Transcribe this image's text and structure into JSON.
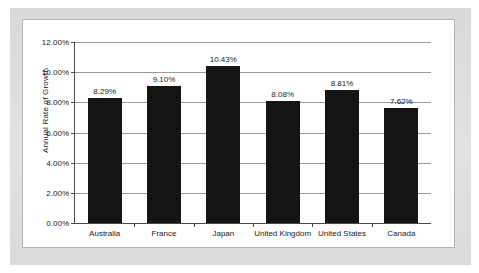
{
  "chart_data": {
    "type": "bar",
    "title": "",
    "xlabel": "",
    "ylabel": "Annual Rate of Growth",
    "ylim": [
      0,
      12
    ],
    "grid": true,
    "legend": "none",
    "y_tick_labels": [
      "0.00%",
      "2.00%",
      "4.00%",
      "6.00%",
      "8.00%",
      "10.00%",
      "12.00%"
    ],
    "y_tick_values": [
      0,
      2,
      4,
      6,
      8,
      10,
      12
    ],
    "categories": [
      "Australia",
      "France",
      "Japan",
      "United Kingdom",
      "United States",
      "Canada"
    ],
    "values": [
      8.29,
      9.1,
      10.43,
      8.08,
      8.81,
      7.62
    ],
    "value_labels": [
      "8.29%",
      "9.10%",
      "10.43%",
      "8.08%",
      "8.81%",
      "7.62%"
    ],
    "bar_color": "#141414",
    "gridline_color": "#9a9a9a",
    "axis_color": "#4a4a4a",
    "plot_background": "#ffffff",
    "page_background": "#dcdcdc"
  }
}
